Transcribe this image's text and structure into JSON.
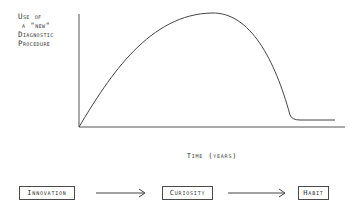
{
  "diagram": {
    "y_axis_label": [
      "Use of",
      " a \"new\"",
      "Diagnostic",
      "Procedure"
    ],
    "x_axis_label": "Time (years)",
    "curve_description": "Rises from origin to a peak, falls steeply, then levels off at a low plateau",
    "stages": [
      {
        "label": "Innovation"
      },
      {
        "label": "Curiosity"
      },
      {
        "label": "Habit"
      }
    ],
    "arrow_glyph": "→"
  },
  "colors": {
    "line": "#444444",
    "text": "#333333",
    "background": "#ffffff"
  }
}
